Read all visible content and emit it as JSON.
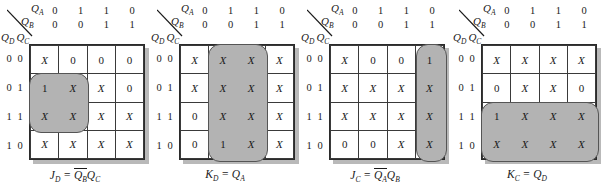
{
  "figure": {
    "type": "karnaugh-map-set",
    "map_count": 4,
    "column_variables": [
      "Q_A",
      "Q_B"
    ],
    "row_variables": [
      "Q_D",
      "Q_C"
    ],
    "column_header_qa": [
      "0",
      "1",
      "1",
      "0"
    ],
    "column_header_qb": [
      "0",
      "0",
      "1",
      "1"
    ],
    "row_labels": [
      [
        "0",
        "0"
      ],
      [
        "0",
        "1"
      ],
      [
        "1",
        "1"
      ],
      [
        "1",
        "0"
      ]
    ],
    "colors": {
      "highlight_fill": "#b3b3b3",
      "highlight_border": "#555555",
      "grid_border": "#2b2b2b",
      "shadow": "#b9b9b9",
      "text": "#1a1a1a",
      "background": "#ffffff"
    }
  },
  "maps": [
    {
      "id": "jd",
      "cells": [
        [
          "X",
          "0",
          "0",
          "0"
        ],
        [
          "1",
          "X",
          "X",
          "0"
        ],
        [
          "X",
          "X",
          "X",
          "X"
        ],
        [
          "X",
          "X",
          "X",
          "X"
        ]
      ],
      "groups": [
        {
          "name": "group-rows-1-2-cols-0-1",
          "row": 1,
          "col": 0,
          "rowspan": 2,
          "colspan": 2
        }
      ],
      "equation": {
        "lhs": "J",
        "lhs_sub": "D",
        "eq": "=",
        "terms": [
          {
            "var": "Q",
            "sub": "B",
            "overbar": true
          },
          {
            "var": "Q",
            "sub": "C",
            "overbar": false
          }
        ],
        "plain": "J_D = Q_B' Q_C"
      }
    },
    {
      "id": "kd",
      "cells": [
        [
          "X",
          "X",
          "X",
          "X"
        ],
        [
          "X",
          "X",
          "X",
          "X"
        ],
        [
          "0",
          "X",
          "X",
          "X"
        ],
        [
          "0",
          "1",
          "X",
          "X"
        ]
      ],
      "groups": [
        {
          "name": "group-all-rows-cols-1-2",
          "row": 0,
          "col": 1,
          "rowspan": 4,
          "colspan": 2
        }
      ],
      "equation": {
        "lhs": "K",
        "lhs_sub": "D",
        "eq": "=",
        "terms": [
          {
            "var": "Q",
            "sub": "A",
            "overbar": false
          }
        ],
        "plain": "K_D = Q_A"
      }
    },
    {
      "id": "jc",
      "cells": [
        [
          "X",
          "0",
          "0",
          "1"
        ],
        [
          "X",
          "X",
          "X",
          "X"
        ],
        [
          "X",
          "X",
          "X",
          "X"
        ],
        [
          "0",
          "0",
          "X",
          "X"
        ]
      ],
      "groups": [
        {
          "name": "group-all-rows-col-3",
          "row": 0,
          "col": 3,
          "rowspan": 4,
          "colspan": 1
        }
      ],
      "equation": {
        "lhs": "J",
        "lhs_sub": "C",
        "eq": "=",
        "terms": [
          {
            "var": "Q",
            "sub": "A",
            "overbar": true
          },
          {
            "var": "Q",
            "sub": "B",
            "overbar": false
          }
        ],
        "plain": "J_C = Q_A' Q_B"
      }
    },
    {
      "id": "kc",
      "cells": [
        [
          "X",
          "X",
          "X",
          "X"
        ],
        [
          "0",
          "X",
          "X",
          "0"
        ],
        [
          "1",
          "X",
          "X",
          "X"
        ],
        [
          "X",
          "X",
          "X",
          "X"
        ]
      ],
      "groups": [
        {
          "name": "group-rows-2-3-all-cols",
          "row": 2,
          "col": 0,
          "rowspan": 2,
          "colspan": 4
        }
      ],
      "equation": {
        "lhs": "K",
        "lhs_sub": "C",
        "eq": "=",
        "terms": [
          {
            "var": "Q",
            "sub": "D",
            "overbar": false
          }
        ],
        "plain": "K_C = Q_D"
      }
    }
  ]
}
